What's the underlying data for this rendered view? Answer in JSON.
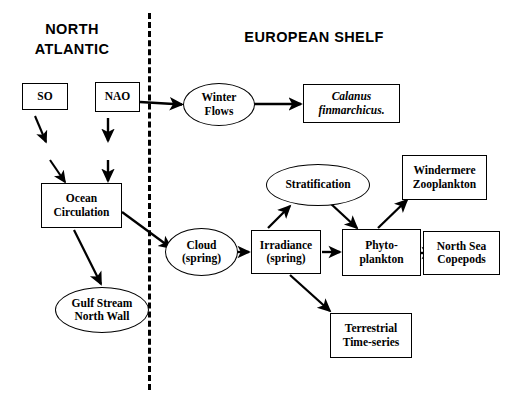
{
  "diagram": {
    "headers": [
      {
        "id": "north-atlantic",
        "label": "NORTH\nATLANTIC"
      },
      {
        "id": "european-shelf",
        "label": "EUROPEAN SHELF"
      }
    ],
    "nodes": [
      {
        "id": "so",
        "label": "SO",
        "shape": "box",
        "italic": false
      },
      {
        "id": "nao",
        "label": "NAO",
        "shape": "box",
        "italic": false
      },
      {
        "id": "ocean-circulation",
        "label": "Ocean\nCirculation",
        "shape": "box",
        "italic": false
      },
      {
        "id": "gulf-stream-north-wall",
        "label": "Gulf Stream\nNorth Wall",
        "shape": "ellipse",
        "italic": false
      },
      {
        "id": "winter-flows",
        "label": "Winter\nFlows",
        "shape": "ellipse",
        "italic": false
      },
      {
        "id": "calanus-finmarchicus",
        "label": "Calanus\nfinmarchicus.",
        "shape": "box",
        "italic": true
      },
      {
        "id": "stratification",
        "label": "Stratification",
        "shape": "ellipse",
        "italic": false
      },
      {
        "id": "windermere-zooplankton",
        "label": "Windermere\nZooplankton",
        "shape": "box",
        "italic": false
      },
      {
        "id": "cloud-spring",
        "label": "Cloud\n(spring)",
        "shape": "ellipse",
        "italic": false
      },
      {
        "id": "irradiance-spring",
        "label": "Irradiance\n(spring)",
        "shape": "box",
        "italic": false
      },
      {
        "id": "phytoplankton",
        "label": "Phyto-\nplankton",
        "shape": "box",
        "italic": false
      },
      {
        "id": "north-sea-copepods",
        "label": "North Sea\nCopepods",
        "shape": "box",
        "italic": false
      },
      {
        "id": "terrestrial-time-series",
        "label": "Terrestrial\nTime-series",
        "shape": "box",
        "italic": false
      }
    ],
    "edges": [
      {
        "from": "so",
        "to": "ocean-circulation"
      },
      {
        "from": "nao",
        "to": "ocean-circulation"
      },
      {
        "from": "nao",
        "to": "winter-flows"
      },
      {
        "from": "winter-flows",
        "to": "calanus-finmarchicus"
      },
      {
        "from": "ocean-circulation",
        "to": "gulf-stream-north-wall"
      },
      {
        "from": "ocean-circulation",
        "to": "cloud-spring"
      },
      {
        "from": "cloud-spring",
        "to": "irradiance-spring"
      },
      {
        "from": "irradiance-spring",
        "to": "stratification"
      },
      {
        "from": "irradiance-spring",
        "to": "phytoplankton"
      },
      {
        "from": "irradiance-spring",
        "to": "terrestrial-time-series"
      },
      {
        "from": "stratification",
        "to": "phytoplankton"
      },
      {
        "from": "phytoplankton",
        "to": "windermere-zooplankton"
      },
      {
        "from": "phytoplankton",
        "to": "north-sea-copepods"
      }
    ],
    "divider": {
      "id": "region-divider",
      "style": "dashed-vertical"
    },
    "colors": {
      "stroke": "#000000",
      "background": "#ffffff"
    }
  }
}
